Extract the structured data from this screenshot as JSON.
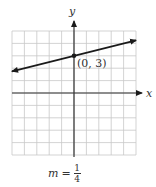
{
  "chart_data": {
    "type": "line",
    "title": "",
    "xlabel": "x",
    "ylabel": "y",
    "xlim": [
      -5,
      5
    ],
    "ylim": [
      -5,
      5
    ],
    "grid": true,
    "series": [
      {
        "name": "line",
        "equation": "y = (1/4)x + 3",
        "slope": 0.25,
        "intercept": 3,
        "x": [
          -5,
          5
        ],
        "y": [
          1.75,
          4.25
        ],
        "arrows": "both"
      }
    ],
    "annotations": [
      {
        "type": "point",
        "x": 0,
        "y": 3,
        "label": "(0, 3)"
      }
    ],
    "caption": "m = 1/4"
  },
  "labels": {
    "x_axis": "x",
    "y_axis": "y",
    "point": "(0, 3)",
    "slope_var": "m",
    "slope_eq": "=",
    "slope_num": "1",
    "slope_den": "4"
  },
  "colors": {
    "grid": "#c8c8c8",
    "axis": "#333333",
    "line": "#1a1a1a"
  }
}
